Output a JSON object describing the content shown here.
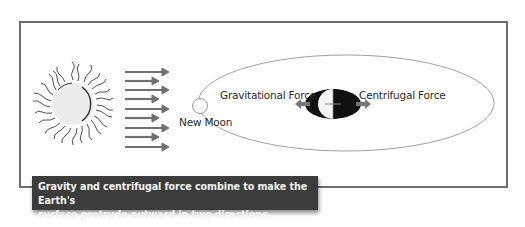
{
  "diagram": {
    "labels": {
      "new_moon": "New Moon",
      "gravitational_force": "Gravitational Force",
      "centrifugal_force": "Centrifugal Force"
    },
    "caption": {
      "line1": "Gravity and centrifugal force combine to make the Earth's",
      "line2": "surface protrude outward in two directions."
    },
    "elements": {
      "sun": "sun-icon",
      "sunlight_arrows": 9,
      "orbit": "elliptical-orbit",
      "moon": "new-moon-circle",
      "earth": "earth-with-tidal-bulge"
    },
    "colors": {
      "frame": "#6d6d6d",
      "caption_bg": "#3c3c3c",
      "caption_text": "#f2f2f2",
      "arrows": "#707070",
      "orbit": "#a0a0a0",
      "earth_dark": "#111111"
    }
  }
}
